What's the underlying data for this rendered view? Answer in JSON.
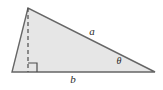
{
  "figure": {
    "kind": "right-triangle-with-altitude",
    "background_color": "#ffffff",
    "canvas": {
      "width": 163,
      "height": 90
    },
    "triangle": {
      "fill_color": "#e6e6e6",
      "stroke_color": "#666666",
      "stroke_width": 1.4,
      "vertices": {
        "apex": {
          "x": 28,
          "y": 8
        },
        "bottom_left": {
          "x": 12,
          "y": 72
        },
        "bottom_right": {
          "x": 155,
          "y": 72
        }
      },
      "points_attr": "28,8 12,72 155,72"
    },
    "altitude": {
      "label": "altitude",
      "stroke_color": "#4d4d4d",
      "stroke_width": 1.2,
      "dash_pattern": "4,3",
      "from": {
        "x": 28,
        "y": 8
      },
      "to": {
        "x": 28,
        "y": 72
      }
    },
    "right_angle_marker": {
      "stroke_color": "#4d4d4d",
      "stroke_width": 1.2,
      "size": 9,
      "path_attr": "M 28 63 L 37 63 L 37 72"
    },
    "labels": {
      "hypotenuse": {
        "text": "a",
        "x": 92,
        "y": 32,
        "font_size": 11
      },
      "base": {
        "text": "b",
        "x": 73,
        "y": 80,
        "font_size": 11
      },
      "angle": {
        "text": "θ",
        "x": 119,
        "y": 62,
        "font_size": 10
      }
    }
  }
}
